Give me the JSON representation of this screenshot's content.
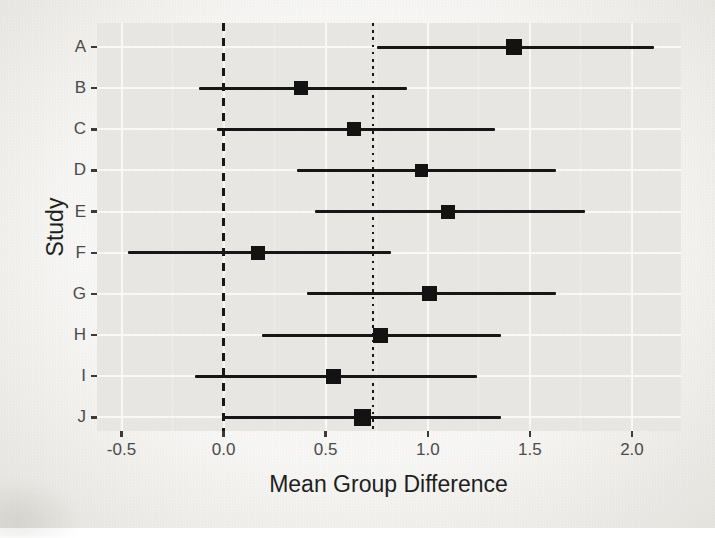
{
  "figure": {
    "kind": "forest plot photograph",
    "background": "#f2f1ed",
    "panel_background": "#e9e8e4",
    "grid_major_color": "#fbfbf8",
    "ink_color": "#161616",
    "axis_text_color": "#4b4b4b"
  },
  "chart_data": {
    "type": "scatter",
    "variant": "forest-plot",
    "title": "",
    "xlabel": "Mean Group Difference",
    "ylabel": "Study",
    "categories": [
      "A",
      "B",
      "C",
      "D",
      "E",
      "F",
      "G",
      "H",
      "I",
      "J"
    ],
    "studies": [
      {
        "study": "A",
        "mean": 1.42,
        "ci_low": 0.75,
        "ci_high": 2.11,
        "marker_px": 16
      },
      {
        "study": "B",
        "mean": 0.38,
        "ci_low": -0.12,
        "ci_high": 0.9,
        "marker_px": 14
      },
      {
        "study": "C",
        "mean": 0.64,
        "ci_low": -0.03,
        "ci_high": 1.33,
        "marker_px": 14
      },
      {
        "study": "D",
        "mean": 0.97,
        "ci_low": 0.36,
        "ci_high": 1.63,
        "marker_px": 13
      },
      {
        "study": "E",
        "mean": 1.1,
        "ci_low": 0.45,
        "ci_high": 1.77,
        "marker_px": 14
      },
      {
        "study": "F",
        "mean": 0.17,
        "ci_low": -0.47,
        "ci_high": 0.82,
        "marker_px": 14
      },
      {
        "study": "G",
        "mean": 1.01,
        "ci_low": 0.41,
        "ci_high": 1.63,
        "marker_px": 15
      },
      {
        "study": "H",
        "mean": 0.77,
        "ci_low": 0.19,
        "ci_high": 1.36,
        "marker_px": 15
      },
      {
        "study": "I",
        "mean": 0.54,
        "ci_low": -0.14,
        "ci_high": 1.24,
        "marker_px": 15
      },
      {
        "study": "J",
        "mean": 0.68,
        "ci_low": 0.0,
        "ci_high": 1.36,
        "marker_px": 17
      }
    ],
    "x_ticks": [
      -0.5,
      0.0,
      0.5,
      1.0,
      1.5,
      2.0
    ],
    "x_tick_labels": [
      "-0.5",
      "0.0",
      "0.5",
      "1.0",
      "1.5",
      "2.0"
    ],
    "x_minor_ticks": [
      -0.25,
      0.25,
      0.75,
      1.25,
      1.75
    ],
    "xlim": [
      -0.62,
      2.24
    ],
    "reference_lines": [
      {
        "x": 0.0,
        "style": "dashed",
        "meaning": "zero / null effect line"
      },
      {
        "x": 0.73,
        "style": "dotted",
        "meaning": "pooled estimate line"
      }
    ],
    "grid": true,
    "legend": "none"
  }
}
